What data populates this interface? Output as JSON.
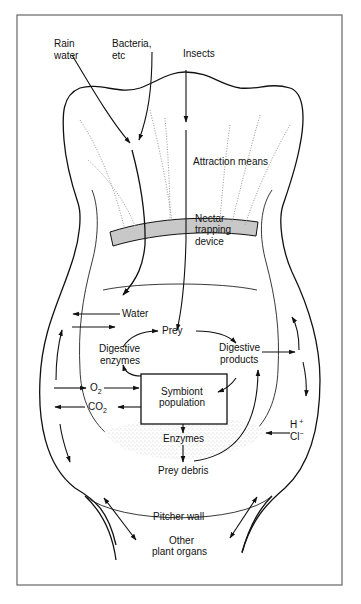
{
  "figure": {
    "colors": {
      "ink": "#111111",
      "frame": "#666666",
      "nectar_band": "#c8c8c8",
      "debris_stipple": "#bbbbbb",
      "background": "#ffffff"
    }
  },
  "labels": {
    "rain_water_1": "Rain",
    "rain_water_2": "water",
    "bacteria_1": "Bacteria,",
    "bacteria_2": "etc",
    "insects": "Insects",
    "attraction": "Attraction means",
    "nectar_1": "Nectar",
    "nectar_2": "trapping",
    "nectar_3": "device",
    "water": "Water",
    "prey": "Prey",
    "digestive_enzymes_1": "Digestive",
    "digestive_enzymes_2": "enzymes",
    "digestive_products_1": "Digestive",
    "digestive_products_2": "products",
    "o2": "O",
    "o2_sub": "2",
    "co2": "CO",
    "co2_sub": "2",
    "symbiont_1": "Symbiont",
    "symbiont_2": "population",
    "enzymes": "Enzymes",
    "h_plus": "H",
    "h_plus_sup": "+",
    "cl_minus": "Cl",
    "cl_minus_sup": "−",
    "prey_debris": "Prey debris",
    "pitcher_wall": "Pitcher wall",
    "other_organs_1": "Other",
    "other_organs_2": "plant organs"
  }
}
